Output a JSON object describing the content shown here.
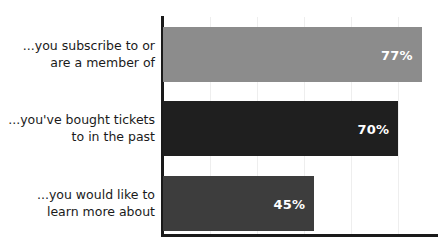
{
  "chart_data": {
    "type": "bar",
    "orientation": "horizontal",
    "title": "",
    "subtitle": "",
    "xlabel": "",
    "ylabel": "",
    "categories": [
      "...you subscribe to or\nare a member of",
      "...you've bought tickets\nto in the past",
      "...you would like to\nlearn more about"
    ],
    "values": [
      77,
      70,
      45
    ],
    "value_labels": [
      "77%",
      "70%",
      "45%"
    ],
    "value_suffix": "%",
    "xlim": [
      0,
      100
    ],
    "grid": true,
    "grid_axis": "x",
    "legend": false,
    "legend_position": "none",
    "bar_colors": [
      "#8c8c8c",
      "#1f1f1f",
      "#3d3d3d"
    ],
    "value_label_color": "#ffffff",
    "axis_color": "#1a1a1a",
    "gridline_color": "#eeeeee",
    "background_color": "#ffffff",
    "bars": [
      {
        "label": "...you subscribe to or\nare a member of",
        "value": 77,
        "value_label": "77%",
        "color": "#8c8c8c"
      },
      {
        "label": "...you've bought tickets\nto in the past",
        "value": 70,
        "value_label": "70%",
        "color": "#1f1f1f"
      },
      {
        "label": "...you would like to\nlearn more about",
        "value": 45,
        "value_label": "45%",
        "color": "#3d3d3d"
      }
    ],
    "gridline_values": [
      14,
      28,
      42,
      56,
      70,
      84,
      98
    ]
  }
}
